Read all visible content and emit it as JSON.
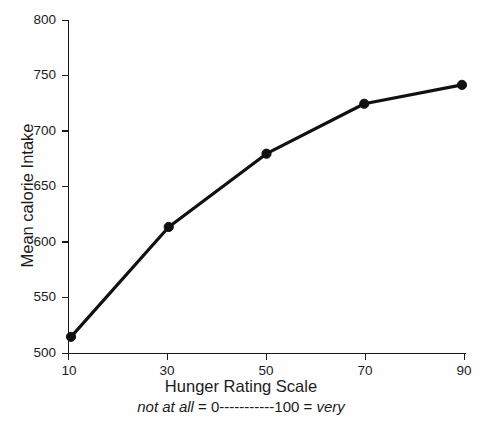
{
  "chart_data": {
    "type": "line",
    "title": "",
    "xlabel": "Hunger Rating Scale",
    "xlabel_sub_left": "not at all",
    "xlabel_sub_mid": " = 0-----------100 = ",
    "xlabel_sub_right": "very",
    "ylabel": "Mean calorie Intake",
    "x": [
      10,
      30,
      50,
      70,
      90
    ],
    "values": [
      515,
      614,
      680,
      725,
      742
    ],
    "categories": [
      "10",
      "30",
      "50",
      "70",
      "90"
    ],
    "xticks": [
      "10",
      "30",
      "50",
      "70",
      "90"
    ],
    "yticks": [
      "500",
      "550",
      "600",
      "650",
      "700",
      "750",
      "800"
    ],
    "xlim": [
      10,
      90
    ],
    "ylim": [
      500,
      800
    ],
    "grid": false,
    "legend": false,
    "series": [
      {
        "name": "Mean calorie Intake",
        "values": [
          515,
          614,
          680,
          725,
          742
        ],
        "color": "#111111",
        "marker": "circle"
      }
    ]
  },
  "style": {
    "background": "#fefefe",
    "axis_color": "#1a1a1a",
    "line_color": "#111111",
    "text_color": "#1c1c1c"
  }
}
